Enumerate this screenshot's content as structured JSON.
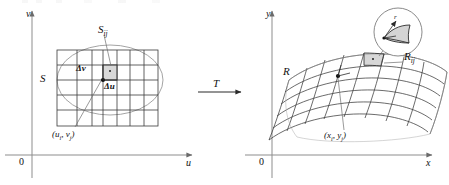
{
  "figure": {
    "type": "math-diagram",
    "transform_label": "T"
  },
  "left_panel": {
    "axis_x_label": "u",
    "axis_y_label": "v",
    "origin_label": "0",
    "region_label": "S",
    "subrect_label": "S",
    "subrect_sub": "ij",
    "delta_v_label": "Δv",
    "delta_u_label": "Δu",
    "corner_point_label": "(u",
    "corner_point_sub1": "i",
    "corner_point_mid": ", v",
    "corner_point_sub2": "j",
    "corner_point_end": ")"
  },
  "right_panel": {
    "axis_x_label": "x",
    "axis_y_label": "y",
    "origin_label": "0",
    "region_label": "R",
    "subpatch_label": "R",
    "subpatch_sub": "ij",
    "point_label": "(x",
    "point_sub1": "i",
    "point_mid": ", y",
    "point_sub2": "j",
    "point_end": ")",
    "inset_label": "r"
  },
  "colors": {
    "line": "#2b2b2b",
    "axis": "#8d8d8d",
    "grid": "#3a3a3a",
    "ellipse": "#9a9a9a",
    "fill": "#c9c9c9",
    "leader": "#6f6f6f"
  }
}
